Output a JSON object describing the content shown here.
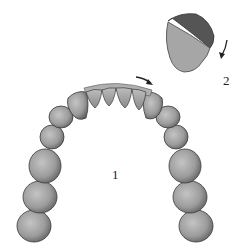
{
  "diagram": {
    "type": "dental-arch-illustration",
    "labels": {
      "arch": "1",
      "tooth_detail": "2"
    },
    "colors": {
      "tooth_fill": "#9a9a9a",
      "tooth_dark": "#5e5e5e",
      "tooth_light": "#c2c2c2",
      "outline": "#3a3a3a",
      "arrow": "#222222"
    },
    "annotations": [
      {
        "id": "arrow-arch",
        "description": "curved arrow pointing along arch to the right"
      },
      {
        "id": "arrow-detail",
        "description": "curved arrow pointing down beside tooth detail"
      }
    ]
  }
}
